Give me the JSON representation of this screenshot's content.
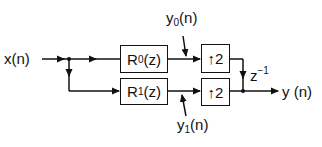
{
  "diagram": {
    "input_label": "x(n)",
    "output_label": "y (n)",
    "filters": [
      {
        "name": "R",
        "sub": "0",
        "arg": "(z)"
      },
      {
        "name": "R",
        "sub": "1",
        "arg": "(z)"
      }
    ],
    "upsamplers": [
      {
        "arrow": "↑",
        "factor": "2"
      },
      {
        "arrow": "↑",
        "factor": "2"
      }
    ],
    "intermediate": [
      {
        "name": "y",
        "sub": "0",
        "arg": "(n)"
      },
      {
        "name": "y",
        "sub": "1",
        "arg": "(n)"
      }
    ],
    "delay": {
      "base": "z",
      "exp": "−1"
    },
    "colors": {
      "line": "#111111",
      "background": "#ffffff"
    }
  }
}
